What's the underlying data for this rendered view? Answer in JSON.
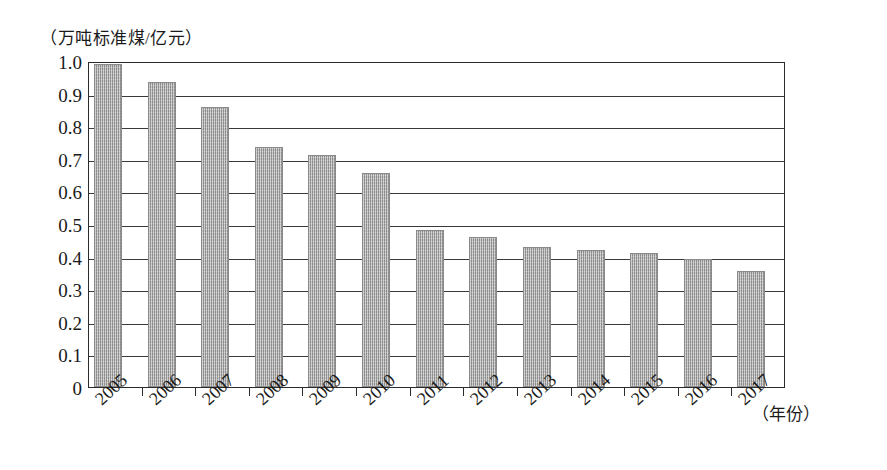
{
  "chart_data": {
    "type": "bar",
    "title": "",
    "subtitle": "",
    "xlabel": "（年份）",
    "ylabel": "（万吨标准煤/亿元）",
    "categories": [
      "2005",
      "2006",
      "2007",
      "2008",
      "2009",
      "2010",
      "2011",
      "2012",
      "2013",
      "2014",
      "2015",
      "2016",
      "2017"
    ],
    "values": [
      0.99,
      0.937,
      0.858,
      0.735,
      0.712,
      0.655,
      0.483,
      0.46,
      0.43,
      0.419,
      0.412,
      0.392,
      0.355
    ],
    "series": [
      {
        "name": "单位GDP能耗",
        "values": [
          0.99,
          0.937,
          0.858,
          0.735,
          0.712,
          0.655,
          0.483,
          0.46,
          0.43,
          0.419,
          0.412,
          0.392,
          0.355
        ]
      }
    ],
    "ylim": [
      0,
      1.0
    ],
    "ytick_step": 0.1,
    "ytick_labels": [
      "1.0",
      "0.9",
      "0.8",
      "0.7",
      "0.6",
      "0.5",
      "0.4",
      "0.3",
      "0.2",
      "0.1",
      "0"
    ],
    "ytick_values": [
      1.0,
      0.9,
      0.8,
      0.7,
      0.6,
      0.5,
      0.4,
      0.3,
      0.2,
      0.1,
      0
    ],
    "grid": true,
    "grid_axis": "y",
    "legend": false,
    "legend_position": "none",
    "bar_color": "#9e9e9e",
    "bar_fill_style": "gray-hatch",
    "axis_color": "#2b2b2b",
    "xtick_label_rotation": -42
  },
  "figure": {
    "y_unit_caption": "（万吨标准煤/亿元）",
    "x_unit_caption": "（年份）"
  }
}
